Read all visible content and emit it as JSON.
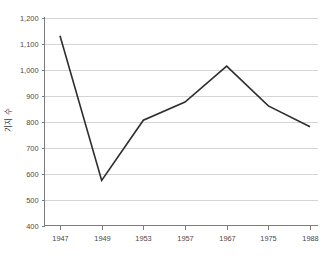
{
  "title_sliver": {
    "text": "···················",
    "note_visible": "cropped"
  },
  "axes": {
    "y_label": "기지 수",
    "x_label": "",
    "y_ticks": [
      "400",
      "500",
      "600",
      "700",
      "800",
      "900",
      "1,000",
      "1,100",
      "1,200"
    ],
    "x_ticks": [
      "1947",
      "1949",
      "1953",
      "1957",
      "1967",
      "1975",
      "1988"
    ]
  },
  "colors": {
    "line": "#2e2e2e",
    "grid": "#c9c9c9",
    "axis": "#7d7d7d",
    "background": "#ffffff",
    "tick_text": "#4a4a4a"
  },
  "chart_data": {
    "type": "line",
    "title": "",
    "xlabel": "",
    "ylabel": "기지 수",
    "categories": [
      "1947",
      "1949",
      "1953",
      "1957",
      "1967",
      "1975",
      "1988"
    ],
    "values": [
      1130,
      573,
      805,
      875,
      1013,
      860,
      780
    ],
    "series": [
      {
        "name": "기지 수",
        "values": [
          1130,
          573,
          805,
          875,
          1013,
          860,
          780
        ]
      }
    ],
    "ylim": [
      400,
      1200
    ],
    "ytick_step": 100,
    "grid": "horizontal",
    "legend": "none"
  }
}
